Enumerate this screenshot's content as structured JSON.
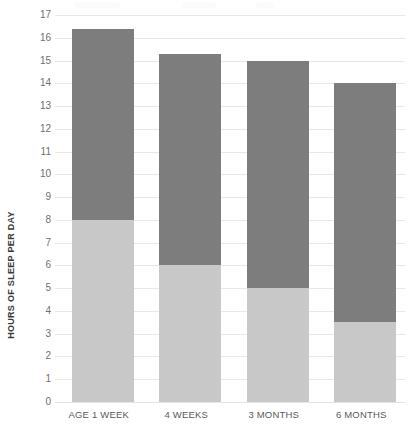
{
  "chart_data": {
    "type": "bar",
    "subtype": "stacked-column",
    "title": "",
    "xlabel": "",
    "ylabel": "HOURS OF SLEEP PER DAY",
    "categories": [
      "AGE 1 WEEK",
      "4 WEEKS",
      "3 MONTHS",
      "6 MONTHS"
    ],
    "series": [
      {
        "name": "daytime-sleep",
        "color": "#c8c8c8",
        "values": [
          8.0,
          6.0,
          5.0,
          3.5
        ]
      },
      {
        "name": "nighttime-sleep",
        "color": "#7d7d7d",
        "values": [
          8.4,
          9.3,
          10.0,
          10.5
        ]
      }
    ],
    "totals": [
      16.4,
      15.3,
      15.0,
      14.0
    ],
    "ylim": [
      0,
      17
    ],
    "ytick_step": 1,
    "yticks": [
      "0",
      "1",
      "2",
      "3",
      "4",
      "5",
      "6",
      "7",
      "8",
      "9",
      "10",
      "11",
      "12",
      "13",
      "14",
      "15",
      "16",
      "17"
    ],
    "grid": true,
    "legend": "none",
    "colors": {
      "segment_light": "#c8c8c8",
      "segment_dark": "#7d7d7d",
      "gridline": "#e8e8ea",
      "tick_text": "#6f6f72",
      "axis_title_text": "#3b3b3b",
      "category_text": "#5a5a5d",
      "background": "#ffffff"
    }
  }
}
